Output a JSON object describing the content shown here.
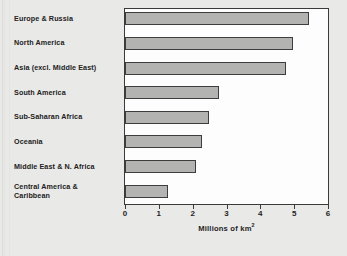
{
  "chart_data": {
    "type": "bar",
    "orientation": "horizontal",
    "title": "",
    "xlabel": "Millions of km2",
    "xlabel_display": "Millions of km",
    "xlabel_superscript": "2",
    "ylabel": "",
    "categories": [
      "Europe & Russia",
      "North America",
      "Asia (excl. Middle East)",
      "South America",
      "Sub-Saharan Africa",
      "Oceania",
      "Middle East & N. Africa",
      "Central America & Caribbean"
    ],
    "values": [
      5.45,
      4.98,
      4.75,
      2.78,
      2.48,
      2.28,
      2.1,
      1.28
    ],
    "xlim": [
      0,
      6
    ],
    "xticks": [
      0,
      1,
      2,
      3,
      4,
      5,
      6
    ],
    "xtick_labels": [
      "0",
      "1",
      "2",
      "3",
      "4",
      "5",
      "6"
    ],
    "grid": false,
    "legend": null,
    "bar_fill_color": "#b3b3b1",
    "bar_edge_color": "#3d3d3d",
    "plot_background": "#fdfdfd",
    "figure_background": "#e9e9e7"
  },
  "category_label_lines": [
    [
      "Europe & Russia"
    ],
    [
      "North America"
    ],
    [
      "Asia (excl. Middle East)"
    ],
    [
      "South America"
    ],
    [
      "Sub-Saharan Africa"
    ],
    [
      "Oceania"
    ],
    [
      "Middle East & N. Africa"
    ],
    [
      "Central America &",
      "Caribbean"
    ]
  ]
}
